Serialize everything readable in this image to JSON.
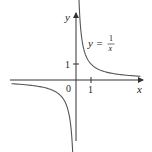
{
  "chart_data": {
    "type": "line",
    "title": "",
    "equation_label": {
      "lhs": "y =",
      "numerator": "1",
      "denominator": "x"
    },
    "xlabel": "x",
    "ylabel": "y",
    "x_ticks": [
      {
        "value": 1,
        "label": "1"
      }
    ],
    "y_ticks": [
      {
        "value": 1,
        "label": "1"
      }
    ],
    "origin_label": "0",
    "xlim": [
      -4.4,
      4.4
    ],
    "ylim": [
      -3.8,
      4.1
    ],
    "grid": false,
    "legend": null,
    "series": [
      {
        "name": "y = 1/x",
        "function": "1/x",
        "branches": [
          {
            "x_range": [
              0.12,
              4.3
            ]
          },
          {
            "x_range": [
              -4.3,
              -0.16
            ]
          }
        ]
      }
    ],
    "colors": {
      "curve": "#555555",
      "axis": "#333333"
    }
  }
}
